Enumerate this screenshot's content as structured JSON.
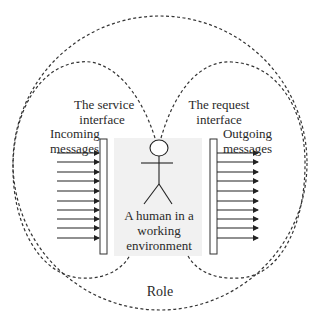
{
  "labels": {
    "service_interface_line1": "The service",
    "service_interface_line2": "interface",
    "request_interface_line1": "The request",
    "request_interface_line2": "interface",
    "incoming_line1": "Incoming",
    "incoming_line2": "messages",
    "outgoing_line1": "Outgoing",
    "outgoing_line2": "messages",
    "human_line1": "A human in a",
    "human_line2": "working",
    "human_line3": "environment",
    "role": "Role"
  },
  "arrows": {
    "incoming_count": 10,
    "outgoing_count": 10
  },
  "colors": {
    "stroke": "#333333",
    "shade": "#f1f1f1"
  }
}
